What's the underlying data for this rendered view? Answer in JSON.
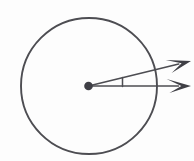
{
  "figure": {
    "description": "A circle drawn with a thin dark outline; a filled dot marks its centre. Two arrow-tipped rays start at the centre and extend to the right past the circle's edge. A short vertical tick joins the two rays, marking the angle between them.",
    "background_color": "#fdfdfd",
    "stroke_color": "#4d4d52",
    "fill_color": "#3f3f45",
    "canvas": {
      "width": 194,
      "height": 161
    },
    "circle": {
      "label": "circle",
      "center_x": 89,
      "center_y": 86,
      "radius": 68,
      "stroke_width": 1.9
    },
    "center_point": {
      "label": "center point",
      "x": 88.5,
      "y": 86,
      "radius": 4.3
    },
    "rays": [
      {
        "name": "upper-ray",
        "label": "upper ray",
        "start_x": 88.5,
        "start_y": 86,
        "end_x": 191,
        "end_y": 61,
        "stroke_width": 1.7,
        "arrowhead": "open-barbed"
      },
      {
        "name": "lower-ray",
        "label": "lower ray",
        "start_x": 88.5,
        "start_y": 86,
        "end_x": 191,
        "end_y": 86,
        "stroke_width": 1.7,
        "arrowhead": "open-barbed"
      }
    ],
    "angle_tick": {
      "label": "angle tick mark",
      "x": 122.5,
      "y_top": 77.5,
      "y_bottom": 86.5,
      "stroke_width": 1.5
    },
    "arrowheads": [
      {
        "name": "upper-arrowhead",
        "tip_x": 191,
        "tip_y": 61,
        "length": 23,
        "half_width": 7
      },
      {
        "name": "lower-arrowhead",
        "tip_x": 191,
        "tip_y": 86.5,
        "length": 23,
        "half_width": 7
      }
    ]
  }
}
